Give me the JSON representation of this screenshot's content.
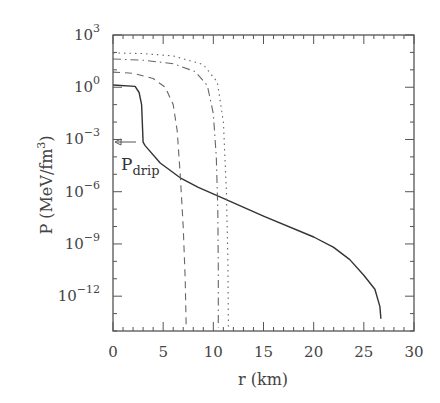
{
  "chart_data": {
    "type": "line",
    "title": "",
    "xlabel": "r (km)",
    "ylabel": "P (MeV/fm3)",
    "ylabel_parts": {
      "main": "P (MeV/fm",
      "sup": "3",
      "close": ")"
    },
    "xlim": [
      0,
      30
    ],
    "ylim_log10": [
      -14,
      3
    ],
    "yscale": "log",
    "grid": false,
    "legend": null,
    "x_ticks": [
      0,
      5,
      10,
      15,
      20,
      25,
      30
    ],
    "x_tick_labels": [
      "0",
      "5",
      "10",
      "15",
      "20",
      "25",
      "30"
    ],
    "y_ticks_log10": [
      3,
      0,
      -3,
      -6,
      -9,
      -12
    ],
    "y_tick_labels": [
      {
        "base": "10",
        "exp": "3"
      },
      {
        "base": "10",
        "exp": "0"
      },
      {
        "base": "10",
        "exp": "−3"
      },
      {
        "base": "10",
        "exp": "−6"
      },
      {
        "base": "10",
        "exp": "−9"
      },
      {
        "base": "10",
        "exp": "−12"
      }
    ],
    "annotations": [
      {
        "text": "P",
        "sub": "drip",
        "x": 0.3,
        "log10_y": -3.15,
        "arrow": "left-pointing arrow toward y-axis"
      }
    ],
    "series": [
      {
        "name": "solid",
        "style": "solid",
        "x": [
          0,
          2.2,
          2.6,
          2.85,
          3.0,
          3.2,
          4.7,
          6.7,
          8.5,
          10.5,
          15,
          20,
          22,
          23.6,
          25,
          26.1,
          26.6,
          26.7
        ],
        "log10_y": [
          0.13,
          0.05,
          -0.3,
          -1.0,
          -3.15,
          -3.35,
          -4.35,
          -5.2,
          -5.75,
          -6.25,
          -7.4,
          -8.6,
          -9.2,
          -9.9,
          -10.8,
          -11.6,
          -12.6,
          -13.3
        ]
      },
      {
        "name": "dashed",
        "style": "dashed",
        "x": [
          0,
          2,
          4,
          5.2,
          6.0,
          6.4,
          6.7,
          7.0,
          7.2,
          7.3
        ],
        "log10_y": [
          0.87,
          0.8,
          0.5,
          0.0,
          -1.0,
          -2.5,
          -5.0,
          -8.0,
          -11.0,
          -13.8
        ]
      },
      {
        "name": "dash-dot",
        "style": "dashdot",
        "x": [
          0,
          3,
          6,
          8.2,
          9.4,
          10.0,
          10.3,
          10.45,
          10.5,
          10.5
        ],
        "log10_y": [
          1.62,
          1.55,
          1.35,
          0.9,
          0.1,
          -1.5,
          -4.0,
          -7.0,
          -10.5,
          -13.8
        ]
      },
      {
        "name": "dotted",
        "style": "dotted",
        "x": [
          0,
          3,
          6,
          9,
          10.4,
          11.0,
          11.3,
          11.45,
          11.5
        ],
        "log10_y": [
          1.97,
          1.93,
          1.8,
          1.3,
          0.3,
          -2.0,
          -6.0,
          -10.0,
          -13.8
        ]
      }
    ]
  }
}
